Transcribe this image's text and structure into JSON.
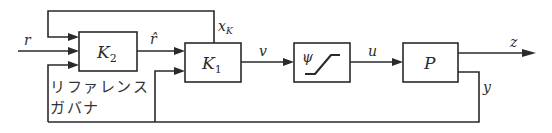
{
  "diagram": {
    "type": "block-diagram",
    "blocks": {
      "k2": {
        "label": "K",
        "sub": "2"
      },
      "k1": {
        "label": "K",
        "sub": "1"
      },
      "saturation": {
        "label": "ψ"
      },
      "plant": {
        "label": "P"
      }
    },
    "signals": {
      "reference": "r",
      "modified_reference": "r̂",
      "controller_state": "x",
      "controller_state_sub": "K",
      "controller_output": "v",
      "plant_input": "u",
      "performance_output": "z",
      "measured_output": "y"
    },
    "annotation": {
      "line1": "リファレンス",
      "line2": "ガバナ"
    },
    "colors": {
      "line": "#2a2a2a",
      "background": "#ffffff"
    }
  }
}
